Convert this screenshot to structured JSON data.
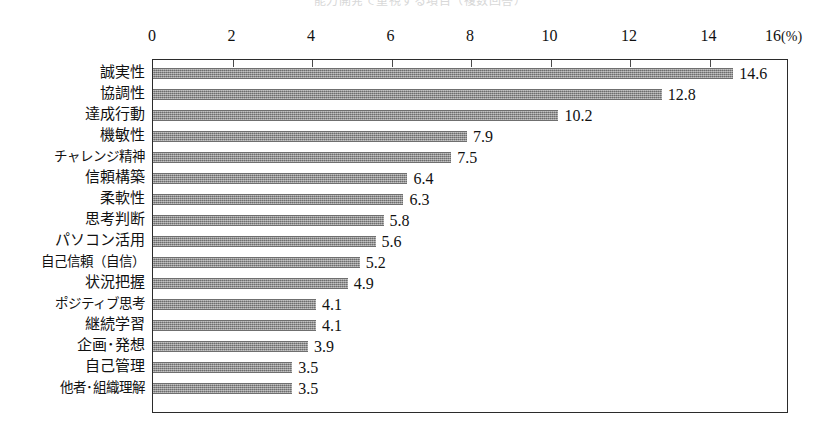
{
  "title_strip": {
    "text": "能力開発で重視する項目（複数回答）"
  },
  "chart_data": {
    "type": "bar",
    "orientation": "horizontal",
    "title": "",
    "xlabel": "(%)",
    "ylabel": "",
    "xlim": [
      0,
      16
    ],
    "grid": false,
    "legend": false,
    "axis_position": "top",
    "xticks": [
      0,
      2,
      4,
      6,
      8,
      10,
      12,
      14,
      16
    ],
    "xtick_labels": [
      "0",
      "2",
      "4",
      "6",
      "8",
      "10",
      "12",
      "14",
      "16"
    ],
    "unit_label": "(%)",
    "categories": [
      "誠実性",
      "協調性",
      "達成行動",
      "機敏性",
      "チャレンジ精神",
      "信頼構築",
      "柔軟性",
      "思考判断",
      "パソコン活用",
      "自己信頼（自信）",
      "状況把握",
      "ポジティブ思考",
      "継続学習",
      "企画･発想",
      "自己管理",
      "他者･組織理解"
    ],
    "values": [
      14.6,
      12.8,
      10.2,
      7.9,
      7.5,
      6.4,
      6.3,
      5.8,
      5.6,
      5.2,
      4.9,
      4.1,
      4.1,
      3.9,
      3.5,
      3.5
    ],
    "value_labels": [
      "14.6",
      "12.8",
      "10.2",
      "7.9",
      "7.5",
      "6.4",
      "6.3",
      "5.8",
      "5.6",
      "5.2",
      "4.9",
      "4.1",
      "4.1",
      "3.9",
      "3.5",
      "3.5"
    ],
    "bar_color": "#8a8a8a",
    "frame_color": "#2b2b2b"
  }
}
